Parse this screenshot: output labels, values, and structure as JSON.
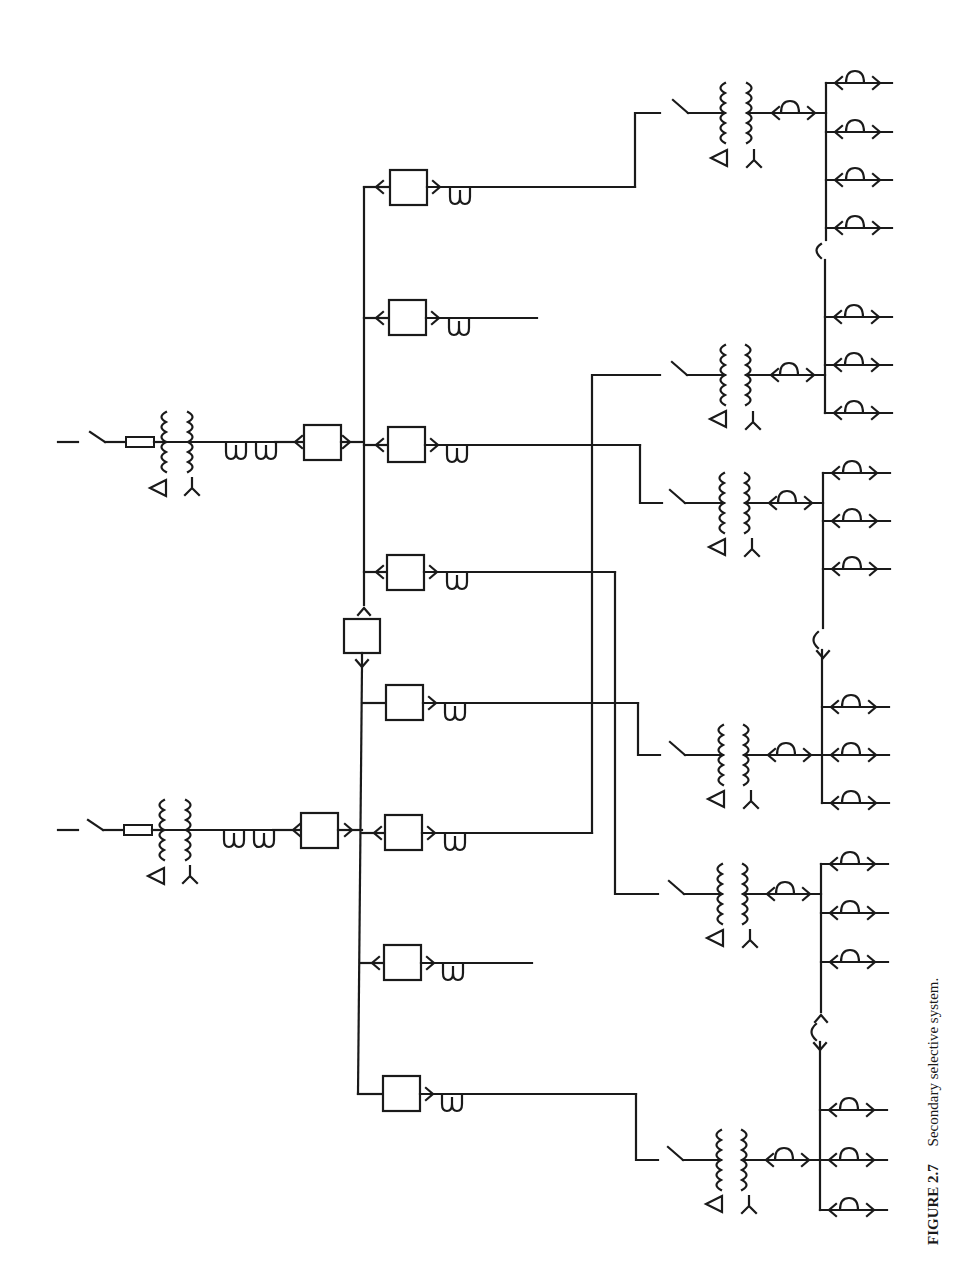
{
  "figure": {
    "number": "FIGURE 2.7",
    "title": "Secondary selective system."
  },
  "diagram": {
    "type": "single-line electrical diagram",
    "orientation": "rotated 90 degrees counter-clockwise",
    "colors": {
      "line": "#1a1a1a",
      "background": "#ffffff"
    },
    "primary_sources": [
      {
        "id": "source-1",
        "y": 445,
        "elements": [
          "incoming-line",
          "disconnect-switch",
          "fuse",
          "delta-wye-transformer",
          "current-transformer",
          "current-transformer",
          "main-breaker"
        ],
        "primary_winding": "delta",
        "secondary_winding": "wye"
      },
      {
        "id": "source-2",
        "y": 833,
        "elements": [
          "incoming-line",
          "disconnect-switch",
          "fuse",
          "delta-wye-transformer",
          "current-transformer",
          "current-transformer",
          "main-breaker"
        ],
        "primary_winding": "delta",
        "secondary_winding": "wye"
      }
    ],
    "main_bus": {
      "x": 362,
      "tie_breaker": {
        "y": 636,
        "state": "normally-open"
      },
      "feeders": [
        {
          "y": 187,
          "breaker": true,
          "ct": true,
          "feeds": "transformer-1"
        },
        {
          "y": 318,
          "breaker": true,
          "ct": true,
          "feeds": "spare"
        },
        {
          "y": 445,
          "breaker": true,
          "ct": true,
          "feeds": "transformer-3"
        },
        {
          "y": 572,
          "breaker": true,
          "ct": true,
          "feeds": "transformer-5"
        },
        {
          "y": 703,
          "breaker": true,
          "ct": true,
          "feeds": "transformer-4"
        },
        {
          "y": 833,
          "breaker": true,
          "ct": true,
          "feeds": "transformer-2"
        },
        {
          "y": 963,
          "breaker": true,
          "ct": true,
          "feeds": "spare"
        },
        {
          "y": 1094,
          "breaker": true,
          "ct": true,
          "feeds": "transformer-6"
        }
      ]
    },
    "secondary_substations": [
      {
        "id": "transformer-1",
        "y": 115,
        "winding": "delta-wye",
        "bus": "A",
        "loads": 4
      },
      {
        "id": "transformer-2",
        "y": 375,
        "winding": "delta-wye",
        "bus": "B",
        "loads": 3
      },
      {
        "id": "transformer-3",
        "y": 503,
        "winding": "delta-wye",
        "bus": "C",
        "loads": 3
      },
      {
        "id": "transformer-4",
        "y": 755,
        "winding": "delta-wye",
        "bus": "D",
        "loads": 3
      },
      {
        "id": "transformer-5",
        "y": 894,
        "winding": "delta-wye",
        "bus": "E",
        "loads": 3
      },
      {
        "id": "transformer-6",
        "y": 1160,
        "winding": "delta-wye",
        "bus": "F",
        "loads": 3
      }
    ],
    "secondary_ties": [
      {
        "between": [
          "A",
          "B"
        ],
        "y": 250
      },
      {
        "between": [
          "C",
          "D"
        ],
        "y": 640
      },
      {
        "between": [
          "E",
          "F"
        ],
        "y": 1032
      }
    ],
    "symbols": {
      "delta": "Δ",
      "wye": "⅄"
    }
  }
}
